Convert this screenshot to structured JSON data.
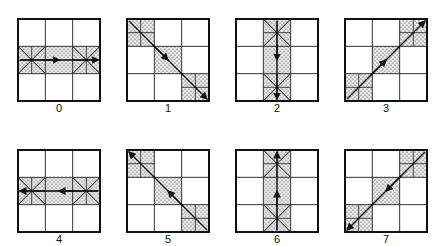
{
  "figure": {
    "grid_size": 3,
    "panels": [
      {
        "label": "0",
        "pattern": "horizontal-middle-row",
        "direction": "left-to-right",
        "cells": [
          [
            1,
            0
          ],
          [
            1,
            1
          ],
          [
            1,
            2
          ]
        ],
        "subdivided": [
          [
            1,
            0
          ],
          [
            1,
            2
          ]
        ],
        "cross": true
      },
      {
        "label": "1",
        "pattern": "main-diagonal",
        "direction": "top-left-to-bottom-right",
        "cells": [
          [
            0,
            0
          ],
          [
            1,
            1
          ],
          [
            2,
            2
          ]
        ],
        "subdivided": [
          [
            0,
            0
          ],
          [
            2,
            2
          ]
        ],
        "cross": false
      },
      {
        "label": "2",
        "pattern": "vertical-middle-column",
        "direction": "top-to-bottom",
        "cells": [
          [
            0,
            1
          ],
          [
            1,
            1
          ],
          [
            2,
            1
          ]
        ],
        "subdivided": [
          [
            0,
            1
          ],
          [
            2,
            1
          ]
        ],
        "cross": true
      },
      {
        "label": "3",
        "pattern": "anti-diagonal",
        "direction": "bottom-left-to-top-right",
        "cells": [
          [
            2,
            0
          ],
          [
            1,
            1
          ],
          [
            0,
            2
          ]
        ],
        "subdivided": [
          [
            2,
            0
          ],
          [
            0,
            2
          ]
        ],
        "cross": false
      },
      {
        "label": "4",
        "pattern": "horizontal-middle-row",
        "direction": "right-to-left",
        "cells": [
          [
            1,
            0
          ],
          [
            1,
            1
          ],
          [
            1,
            2
          ]
        ],
        "subdivided": [
          [
            1,
            0
          ],
          [
            1,
            2
          ]
        ],
        "cross": true
      },
      {
        "label": "5",
        "pattern": "main-diagonal",
        "direction": "bottom-right-to-top-left",
        "cells": [
          [
            0,
            0
          ],
          [
            1,
            1
          ],
          [
            2,
            2
          ]
        ],
        "subdivided": [
          [
            0,
            0
          ],
          [
            2,
            2
          ]
        ],
        "cross": false
      },
      {
        "label": "6",
        "pattern": "vertical-middle-column",
        "direction": "bottom-to-top",
        "cells": [
          [
            0,
            1
          ],
          [
            1,
            1
          ],
          [
            2,
            1
          ]
        ],
        "subdivided": [
          [
            0,
            1
          ],
          [
            2,
            1
          ]
        ],
        "cross": true
      },
      {
        "label": "7",
        "pattern": "anti-diagonal",
        "direction": "top-right-to-bottom-left",
        "cells": [
          [
            2,
            0
          ],
          [
            1,
            1
          ],
          [
            0,
            2
          ]
        ],
        "subdivided": [
          [
            2,
            0
          ],
          [
            0,
            2
          ]
        ],
        "cross": false
      }
    ]
  }
}
